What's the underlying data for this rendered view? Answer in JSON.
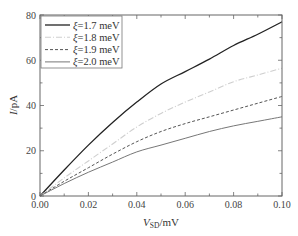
{
  "chart_data": {
    "type": "line",
    "title": "",
    "xlabel": "V_SD/mV",
    "xlabel_main": "V",
    "xlabel_sub": "SD",
    "xlabel_unit": "/mV",
    "ylabel": "I/pA",
    "ylabel_main": "I",
    "ylabel_unit": "/pA",
    "xlim": [
      0,
      0.1
    ],
    "ylim": [
      0,
      80
    ],
    "x_ticks": [
      0.0,
      0.02,
      0.04,
      0.06,
      0.08,
      0.1
    ],
    "x_tick_labels": [
      "0.00",
      "0.02",
      "0.04",
      "0.06",
      "0.08",
      "0.10"
    ],
    "x_minor_step": 0.01,
    "y_ticks": [
      0,
      20,
      40,
      60,
      80
    ],
    "y_tick_labels": [
      "0",
      "20",
      "40",
      "60",
      "80"
    ],
    "y_minor_step": 10,
    "grid": false,
    "legend_position": "upper left",
    "x": [
      0.0,
      0.01,
      0.02,
      0.03,
      0.04,
      0.05,
      0.06,
      0.07,
      0.08,
      0.09,
      0.1
    ],
    "series": [
      {
        "name": "ξ=1.7 meV",
        "symbol": "ξ",
        "label_rest": "=1.7 meV",
        "color": "#222222",
        "dash": "",
        "width": 1.3,
        "values": [
          0,
          11.5,
          22.5,
          32.5,
          41.5,
          49.5,
          55.0,
          60.5,
          66.5,
          71.5,
          77.0
        ]
      },
      {
        "name": "ξ=1.8 meV",
        "symbol": "ξ",
        "label_rest": "=1.8 meV",
        "color": "#cfcfcf",
        "dash": "6,2,1,2",
        "width": 1.1,
        "values": [
          0,
          8.0,
          15.5,
          23.0,
          30.5,
          36.5,
          41.5,
          46.0,
          50.5,
          53.5,
          56.5
        ]
      },
      {
        "name": "ξ=1.9 meV",
        "symbol": "ξ",
        "label_rest": "=1.9 meV",
        "color": "#555555",
        "dash": "3,2",
        "width": 1.0,
        "values": [
          0,
          6.5,
          12.5,
          18.5,
          24.0,
          28.5,
          32.0,
          35.0,
          38.0,
          41.0,
          44.0
        ]
      },
      {
        "name": "ξ=2.0 meV",
        "symbol": "ξ",
        "label_rest": "=2.0 meV",
        "color": "#777777",
        "dash": "",
        "width": 1.0,
        "values": [
          0,
          5.5,
          10.5,
          15.0,
          19.5,
          22.5,
          25.5,
          28.5,
          31.0,
          33.0,
          35.0
        ]
      }
    ]
  },
  "colors": {
    "frame": "#666666",
    "tick": "#666666",
    "legend_border": "#777777"
  }
}
